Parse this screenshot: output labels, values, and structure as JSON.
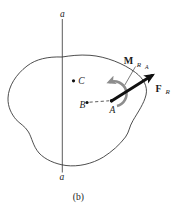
{
  "figure": {
    "caption": "(b)",
    "axis": {
      "top_label": "a",
      "bottom_label": "a"
    },
    "points": {
      "C": {
        "label": "C"
      },
      "B": {
        "label": "B"
      },
      "A": {
        "label": "A"
      }
    },
    "moment": {
      "symbol": "M",
      "subscript": "R",
      "subsubscript": "A",
      "direction": "counterclockwise"
    },
    "force": {
      "symbol": "F",
      "subscript": "R"
    }
  },
  "colors": {
    "background": "#ffffff",
    "body_outline": "#3a3a3a",
    "axis_line": "#4a4a4a",
    "moment_arrow": "#8d8d8d",
    "force_arrow": "#101010",
    "text": "#1a1a1a"
  }
}
